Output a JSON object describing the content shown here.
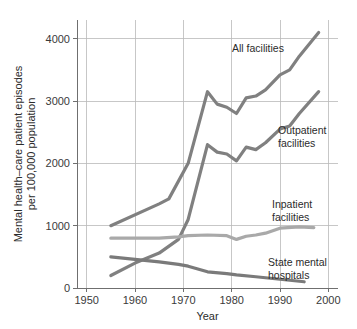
{
  "chart_data": {
    "type": "line",
    "title": "",
    "xlabel": "Year",
    "ylabel": "Mental health–care patient episodes per 100,000 population",
    "ylabel_line1": "Mental health–care patient episodes",
    "ylabel_line2": "per 100,000 population",
    "xlim": [
      1948,
      2002
    ],
    "ylim": [
      0,
      4300
    ],
    "xticks": [
      1950,
      1960,
      1970,
      1980,
      1990,
      2000
    ],
    "xtick_labels": [
      "1950",
      "1960",
      "1970",
      "1980",
      "1990",
      "2000"
    ],
    "yticks": [
      0,
      1000,
      2000,
      3000,
      4000
    ],
    "ytick_labels": [
      "0",
      "1000",
      "2000",
      "3000",
      "4000"
    ],
    "grid": true,
    "legend_position": "inline-annotations",
    "colors": {
      "all_facilities": "#808080",
      "outpatient_facilities": "#808080",
      "inpatient_facilities": "#a9a9a9",
      "state_mental_hospitals": "#7a7a7a",
      "gridline": "#b9b9b9",
      "spine": "#6f6f6f",
      "text": "#2b2b2b",
      "background": "#ffffff"
    },
    "series": [
      {
        "name": "All facilities",
        "label": "All facilities",
        "color": "#808080",
        "x": [
          1955,
          1965,
          1967,
          1971,
          1975,
          1977,
          1979,
          1981,
          1983,
          1985,
          1987,
          1990,
          1992,
          1994,
          1998
        ],
        "values": [
          1000,
          1350,
          1430,
          2000,
          3150,
          2950,
          2900,
          2800,
          3050,
          3080,
          3180,
          3420,
          3500,
          3720,
          4100
        ]
      },
      {
        "name": "Outpatient facilities",
        "label": "Outpatient facilities",
        "color": "#808080",
        "x": [
          1955,
          1960,
          1965,
          1969,
          1971,
          1975,
          1977,
          1979,
          1981,
          1983,
          1985,
          1987,
          1990,
          1992,
          1994,
          1998
        ],
        "values": [
          200,
          400,
          560,
          780,
          1100,
          2300,
          2180,
          2150,
          2040,
          2260,
          2220,
          2330,
          2550,
          2600,
          2800,
          3150
        ]
      },
      {
        "name": "Inpatient facilities",
        "label": "Inpatient facilities",
        "color": "#a9a9a9",
        "x": [
          1955,
          1965,
          1969,
          1971,
          1975,
          1979,
          1981,
          1983,
          1985,
          1987,
          1990,
          1994,
          1997
        ],
        "values": [
          800,
          800,
          820,
          840,
          850,
          840,
          780,
          830,
          850,
          880,
          960,
          980,
          970
        ]
      },
      {
        "name": "State mental hospitals",
        "label": "State mental hospitals",
        "color": "#7a7a7a",
        "x": [
          1955,
          1960,
          1965,
          1969,
          1971,
          1975,
          1979,
          1981,
          1985,
          1990,
          1995
        ],
        "values": [
          500,
          460,
          420,
          380,
          350,
          260,
          230,
          210,
          180,
          140,
          100
        ]
      }
    ],
    "annotations": [
      {
        "text": "All facilities",
        "x_px": 232,
        "y_px": 52
      },
      {
        "text": "Outpatient",
        "x_px": 278,
        "y_px": 134
      },
      {
        "text": "facilities",
        "x_px": 278,
        "y_px": 147
      },
      {
        "text": "Inpatient",
        "x_px": 272,
        "y_px": 208
      },
      {
        "text": "facilities",
        "x_px": 272,
        "y_px": 221
      },
      {
        "text": "State mental",
        "x_px": 268,
        "y_px": 266
      },
      {
        "text": "hospitals",
        "x_px": 268,
        "y_px": 279
      }
    ]
  }
}
